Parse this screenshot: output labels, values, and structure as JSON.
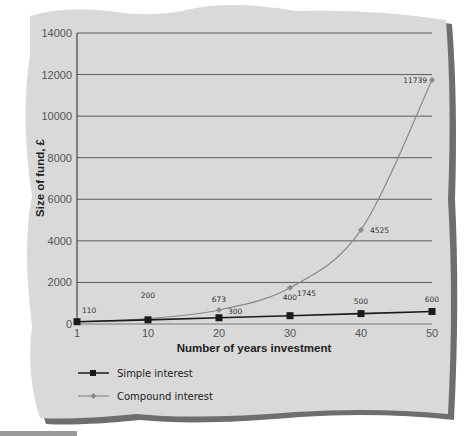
{
  "chart_data": {
    "type": "line",
    "title": "",
    "xlabel": "Number of years investment",
    "ylabel": "Size of fund, £",
    "categories": [
      "1",
      "10",
      "20",
      "30",
      "40",
      "50"
    ],
    "x": [
      1,
      10,
      20,
      30,
      40,
      50
    ],
    "ylim": [
      0,
      14000
    ],
    "yticks": [
      "0",
      "2000",
      "4000",
      "6000",
      "8000",
      "10000",
      "12000",
      "14000"
    ],
    "grid": true,
    "legend_position": "bottom-left",
    "series": [
      {
        "name": "Simple interest",
        "marker": "square",
        "color": "#1a1a1a",
        "values": [
          110,
          200,
          300,
          400,
          500,
          600
        ],
        "labels": [
          "110",
          "200",
          "300",
          "400",
          "500",
          "600"
        ]
      },
      {
        "name": "Compound interest",
        "marker": "diamond",
        "color": "#8a8a8a",
        "values": [
          110,
          259,
          673,
          1745,
          4525,
          11739
        ],
        "labels": [
          "",
          "",
          "673",
          "1745",
          "4525",
          "11739"
        ]
      }
    ]
  },
  "colors": {
    "panel": "#d9d9d9",
    "panel_shadow": "#6e6e6e",
    "gridline": "#5a5a5a",
    "simple_line": "#1a1a1a",
    "compound_line": "#8a8a8a"
  }
}
